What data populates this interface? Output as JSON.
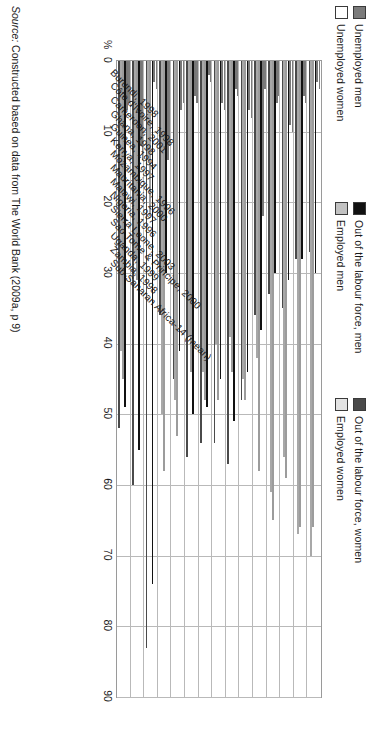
{
  "figure": {
    "percent_axis_label": "%",
    "source_prefix": "Source:",
    "source_text": "Constructed based on data from The World Bank (2009a, p 9)"
  },
  "legend": {
    "row1": [
      {
        "key": "unemployed_men",
        "label": "Unemployed men",
        "color": "#7b7b7b"
      },
      {
        "key": "olf_men",
        "label": "Out of the labour force, men",
        "color": "#111111"
      },
      {
        "key": "olf_women",
        "label": "Out of the labour force, women",
        "color": "#4a4a4a"
      }
    ],
    "row2": [
      {
        "key": "unemployed_women",
        "label": "Unemployed women",
        "color": "#ffffff"
      },
      {
        "key": "employed_men",
        "label": "Employed men",
        "color": "#c2c2c2"
      },
      {
        "key": "employed_women",
        "label": "Employed women",
        "color": "#e3e3e3"
      }
    ]
  },
  "chart_data": {
    "type": "bar",
    "orientation": "horizontal",
    "title": "",
    "subtitle": "",
    "xlabel": "%",
    "ylabel": "",
    "xlim": [
      0,
      90
    ],
    "xticks": [
      0,
      10,
      20,
      30,
      40,
      50,
      60,
      70,
      80,
      90
    ],
    "grid": true,
    "legend_position": "top-left",
    "categories": [
      "Burundi, 1998",
      "Côte d'Ivoire, 1998",
      "Cameroon, 2001",
      "Ghana, 1998",
      "Guinea, 1994",
      "Kenya, 1997",
      "Mozambique, 1996",
      "Mauritania, 2000",
      "Malawi, 1997",
      "Nigeria, 1996",
      "Sierra Leone, 2003",
      "Sao Tome & Principe, 2000",
      "Uganda, 1999",
      "Zambia, 1998",
      "Sub-Saharan Africa-14 (mean)"
    ],
    "series": [
      {
        "name": "Unemployed men",
        "key": "unemployed_men",
        "color": "#7b7b7b",
        "values": [
          4,
          6,
          10,
          5,
          4,
          8,
          5,
          7,
          3,
          6,
          6,
          12,
          4,
          14,
          6
        ]
      },
      {
        "name": "Unemployed women",
        "key": "unemployed_women",
        "color": "#ffffff",
        "values": [
          3,
          5,
          9,
          6,
          22,
          7,
          4,
          6,
          2,
          5,
          7,
          14,
          3,
          12,
          7
        ]
      },
      {
        "name": "Out of the labour force, men",
        "key": "olf_men",
        "color": "#111111",
        "values": [
          30,
          28,
          31,
          30,
          38,
          44,
          51,
          45,
          49,
          50,
          41,
          30,
          74,
          55,
          49
        ]
      },
      {
        "name": "Employed men",
        "key": "employed_men",
        "color": "#c2c2c2",
        "values": [
          66,
          66,
          59,
          65,
          58,
          48,
          44,
          48,
          48,
          44,
          53,
          58,
          22,
          31,
          45
        ]
      },
      {
        "name": "Employed women",
        "key": "employed_women",
        "color": "#e3e3e3",
        "values": [
          70,
          67,
          56,
          61,
          42,
          45,
          39,
          40,
          44,
          39,
          48,
          50,
          14,
          28,
          41
        ]
      },
      {
        "name": "Out of the labour force, women",
        "key": "olf_women",
        "color": "#4a4a4a",
        "values": [
          27,
          28,
          35,
          33,
          36,
          48,
          57,
          54,
          54,
          56,
          45,
          36,
          83,
          60,
          52
        ]
      }
    ]
  }
}
